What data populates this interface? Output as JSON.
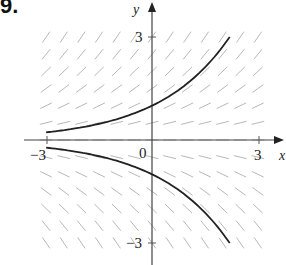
{
  "problem_label": "9.",
  "chart_data": {
    "type": "line",
    "title": "",
    "subtitle": "Direction field with solution curves",
    "xlabel": "x",
    "ylabel": "y",
    "xlim": [
      -3,
      3
    ],
    "ylim": [
      -3,
      3
    ],
    "grid": false,
    "legend": null,
    "x_tick_labels": [
      "-3",
      "0",
      "3"
    ],
    "y_tick_labels": [
      "3",
      "-3"
    ],
    "origin_label": "0",
    "direction_field": {
      "slope_rule": "dy/dx = y/2 (slope depends only on y)",
      "x_step": 0.5,
      "y_step": 0.5,
      "x_range": [
        -3,
        3
      ],
      "y_range": [
        -3,
        3
      ],
      "color": "#b8b8b8"
    },
    "series": [
      {
        "name": "upper solution curve (y = e^(x/2))",
        "color": "#222222",
        "x": [
          -3,
          -2.5,
          -2,
          -1.5,
          -1,
          -0.5,
          0,
          0.5,
          1,
          1.5,
          2,
          2.2
        ],
        "y": [
          0.22,
          0.29,
          0.37,
          0.47,
          0.61,
          0.78,
          1.0,
          1.28,
          1.65,
          2.12,
          2.72,
          3.0
        ]
      },
      {
        "name": "lower solution curve (y = -e^(x/2))",
        "color": "#222222",
        "x": [
          -3,
          -2.5,
          -2,
          -1.5,
          -1,
          -0.5,
          0,
          0.5,
          1,
          1.5,
          2,
          2.2
        ],
        "y": [
          -0.22,
          -0.29,
          -0.37,
          -0.47,
          -0.61,
          -0.78,
          -1.0,
          -1.28,
          -1.65,
          -2.12,
          -2.72,
          -3.0
        ]
      }
    ]
  },
  "labels": {
    "x_axis": "x",
    "y_axis": "y",
    "x_min": "−3",
    "x_max": "3",
    "y_max": "3",
    "y_min": "−3",
    "origin": "0"
  }
}
